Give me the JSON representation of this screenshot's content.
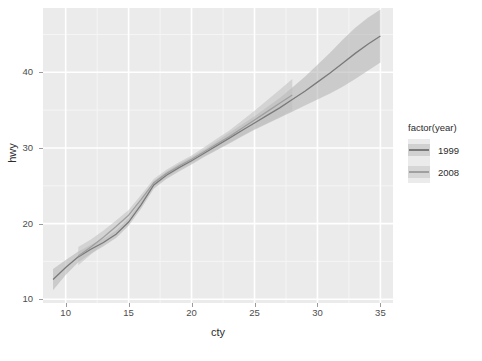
{
  "chart_data": {
    "type": "line",
    "title": "",
    "subtitle": "",
    "xlabel": "cty",
    "ylabel": "hwy",
    "xlim": [
      8.2,
      36.0
    ],
    "ylim": [
      9.5,
      48.5
    ],
    "xticks": [
      10,
      15,
      20,
      25,
      30,
      35
    ],
    "yticks": [
      10,
      20,
      30,
      40
    ],
    "xtick_labels": [
      "10",
      "15",
      "20",
      "25",
      "30",
      "35"
    ],
    "ytick_labels": [
      "10",
      "20",
      "30",
      "40"
    ],
    "grid": true,
    "grid_major_color": "#ffffff",
    "grid_minor_color": "#f5f5f5",
    "panel_background": "#ebebeb",
    "legend": {
      "title": "factor(year)",
      "position": "right",
      "entries": [
        {
          "label": "1999",
          "line_color": "#7a7a7a",
          "ribbon_color": "#bcbcbc"
        },
        {
          "label": "2008",
          "line_color": "#a0a0a0",
          "ribbon_color": "#c4c4c4"
        }
      ]
    },
    "series": [
      {
        "name": "1999",
        "line_color": "#7a7a7a",
        "ribbon_color": "#b0b0b0",
        "ribbon_opacity": 0.55,
        "x": [
          9,
          10,
          11,
          12,
          13,
          14,
          15,
          16,
          17,
          18,
          19,
          20,
          21,
          22,
          23,
          24,
          25,
          26,
          27,
          28,
          29,
          30,
          31,
          32,
          33,
          34,
          35
        ],
        "y": [
          12.6,
          14.2,
          15.6,
          16.6,
          17.5,
          18.6,
          20.2,
          22.5,
          25.1,
          26.4,
          27.4,
          28.3,
          29.3,
          30.3,
          31.3,
          32.3,
          33.3,
          34.3,
          35.3,
          36.4,
          37.5,
          38.7,
          39.9,
          41.2,
          42.5,
          43.7,
          44.8
        ],
        "ymin": [
          11.2,
          13.2,
          14.9,
          16.0,
          17.0,
          18.1,
          19.7,
          22.0,
          24.6,
          25.9,
          26.9,
          27.8,
          28.8,
          29.7,
          30.6,
          31.5,
          32.4,
          33.2,
          34.0,
          34.8,
          35.6,
          36.4,
          37.2,
          38.1,
          39.1,
          40.2,
          41.3
        ],
        "ymax": [
          14.0,
          15.2,
          16.3,
          17.2,
          18.0,
          19.1,
          20.7,
          23.0,
          25.6,
          26.9,
          27.9,
          28.8,
          29.8,
          30.9,
          32.0,
          33.1,
          34.2,
          35.4,
          36.6,
          38.0,
          39.4,
          41.0,
          42.6,
          44.3,
          45.9,
          47.2,
          48.3
        ]
      },
      {
        "name": "2008",
        "line_color": "#a0a0a0",
        "ribbon_color": "#c0c0c0",
        "ribbon_opacity": 0.55,
        "x": [
          11,
          12,
          13,
          14,
          15,
          16,
          17,
          18,
          19,
          20,
          21,
          22,
          23,
          24,
          25,
          26,
          27,
          28
        ],
        "y": [
          15.7,
          16.9,
          18.2,
          19.6,
          21.1,
          23.2,
          25.4,
          26.6,
          27.6,
          28.5,
          29.5,
          30.5,
          31.5,
          32.6,
          33.7,
          34.8,
          35.9,
          37.0
        ],
        "ymin": [
          14.5,
          15.9,
          17.3,
          18.8,
          20.4,
          22.6,
          24.9,
          26.1,
          27.1,
          28.0,
          28.9,
          29.8,
          30.7,
          31.6,
          32.5,
          33.3,
          34.1,
          34.9
        ],
        "ymax": [
          16.9,
          17.9,
          19.1,
          20.4,
          21.8,
          23.8,
          25.9,
          27.1,
          28.1,
          29.0,
          30.1,
          31.2,
          32.3,
          33.6,
          34.9,
          36.3,
          37.7,
          39.1
        ]
      }
    ]
  },
  "axes": {
    "x_title": "cty",
    "y_title": "hwy"
  }
}
